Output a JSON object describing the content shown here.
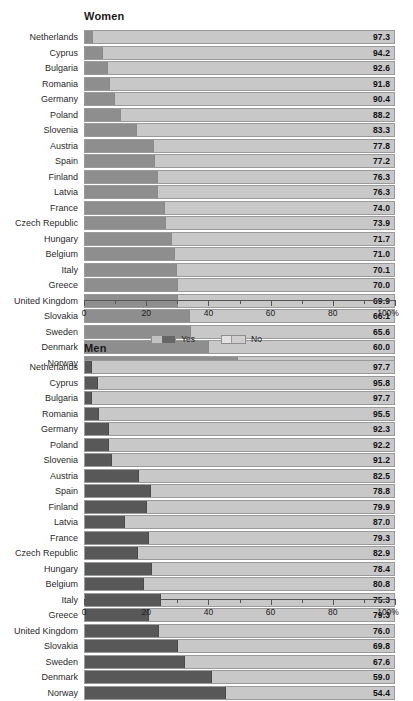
{
  "chart_data": [
    {
      "type": "bar",
      "title": "Women",
      "orientation": "horizontal",
      "stacked": true,
      "xlabel": "",
      "ylabel": "",
      "xlim": [
        0,
        100
      ],
      "xticks": [
        0,
        20,
        40,
        60,
        80,
        100
      ],
      "xticklabels": [
        "0",
        "20",
        "40",
        "60",
        "80",
        "100%"
      ],
      "minor_ticks": [
        10,
        30,
        50,
        70,
        90
      ],
      "grid": false,
      "legend": [
        "Yes",
        "No"
      ],
      "legend_position": "bottom-center",
      "categories": [
        "Netherlands",
        "Cyprus",
        "Bulgaria",
        "Romania",
        "Germany",
        "Poland",
        "Slovenia",
        "Austria",
        "Spain",
        "Finland",
        "Latvia",
        "France",
        "Czech Republic",
        "Hungary",
        "Belgium",
        "Italy",
        "Greece",
        "United Kingdom",
        "Slovakia",
        "Sweden",
        "Denmark",
        "Norway"
      ],
      "series": [
        {
          "name": "Yes",
          "values": [
            2.7,
            5.8,
            7.4,
            8.2,
            9.6,
            11.8,
            16.7,
            22.2,
            22.8,
            23.7,
            23.7,
            26.0,
            26.1,
            28.3,
            29.0,
            29.9,
            30.0,
            30.1,
            33.9,
            34.4,
            40.0,
            49.5
          ]
        },
        {
          "name": "No",
          "values": [
            97.3,
            94.2,
            92.6,
            91.8,
            90.4,
            88.2,
            83.3,
            77.8,
            77.2,
            76.3,
            76.3,
            74.0,
            73.9,
            71.7,
            71.0,
            70.1,
            70.0,
            69.9,
            66.1,
            65.6,
            60.0,
            50.5
          ]
        }
      ],
      "data_labels": [
        "97.3",
        "94.2",
        "92.6",
        "91.8",
        "90.4",
        "88.2",
        "83.3",
        "77.8",
        "77.2",
        "76.3",
        "76.3",
        "74.0",
        "73.9",
        "71.7",
        "71.0",
        "70.1",
        "70.0",
        "69.9",
        "66.1",
        "65.6",
        "60.0",
        "50.5"
      ]
    },
    {
      "type": "bar",
      "title": "Men",
      "orientation": "horizontal",
      "stacked": true,
      "xlabel": "",
      "ylabel": "",
      "xlim": [
        0,
        100
      ],
      "xticks": [
        0,
        20,
        40,
        60,
        80,
        100
      ],
      "xticklabels": [
        "0",
        "20",
        "40",
        "60",
        "80",
        "100%"
      ],
      "minor_ticks": [
        10,
        30,
        50,
        70,
        90
      ],
      "grid": false,
      "legend": [
        "Yes",
        "No"
      ],
      "legend_position": "bottom-center",
      "categories": [
        "Netherlands",
        "Cyprus",
        "Bulgaria",
        "Romania",
        "Germany",
        "Poland",
        "Slovenia",
        "Austria",
        "Spain",
        "Finland",
        "Latvia",
        "France",
        "Czech Republic",
        "Hungary",
        "Belgium",
        "Italy",
        "Greece",
        "United Kingdom",
        "Slovakia",
        "Sweden",
        "Denmark",
        "Norway"
      ],
      "series": [
        {
          "name": "Yes",
          "values": [
            2.3,
            4.2,
            2.3,
            4.5,
            7.7,
            7.8,
            8.8,
            17.5,
            21.2,
            20.1,
            13.0,
            20.7,
            17.1,
            21.6,
            19.2,
            24.7,
            20.7,
            24.0,
            30.2,
            32.4,
            41.0,
            45.6
          ]
        },
        {
          "name": "No",
          "values": [
            97.7,
            95.8,
            97.7,
            95.5,
            92.3,
            92.2,
            91.2,
            82.5,
            78.8,
            79.9,
            87.0,
            79.3,
            82.9,
            78.4,
            80.8,
            75.3,
            79.3,
            76.0,
            69.8,
            67.6,
            59.0,
            54.4
          ]
        }
      ],
      "data_labels": [
        "97.7",
        "95.8",
        "97.7",
        "95.5",
        "92.3",
        "92.2",
        "91.2",
        "82.5",
        "78.8",
        "79.9",
        "87.0",
        "79.3",
        "82.9",
        "78.4",
        "80.8",
        "75.3",
        "79.3",
        "76.0",
        "69.8",
        "67.6",
        "59.0",
        "54.4"
      ]
    }
  ],
  "colors": {
    "yes_women": "#8e8e8e",
    "yes_men": "#585858",
    "no": "#c8c8c8",
    "border": "#9a9a9a",
    "text": "#2a2a2a",
    "background": "#ffffff"
  },
  "legend": {
    "yes_label": "Yes",
    "no_label": "No"
  }
}
